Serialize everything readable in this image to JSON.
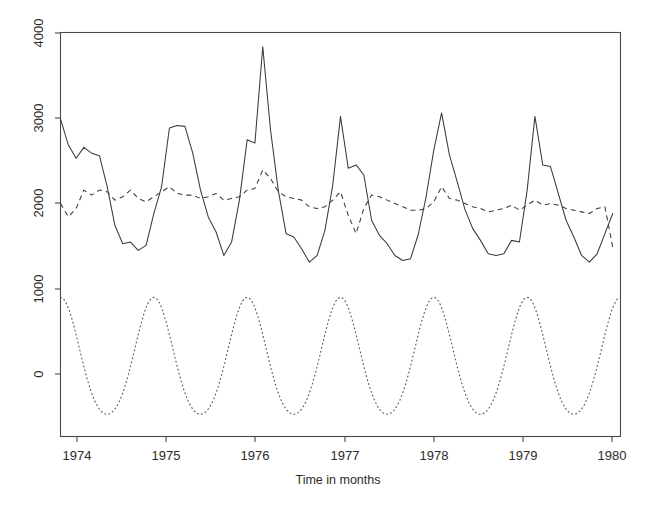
{
  "figure": {
    "background_color": "#ffffff",
    "line_color": "#3a3a3a",
    "axis_color": "#4a4a4a",
    "width": 652,
    "height": 509
  },
  "axes": {
    "x_title": "Time in months",
    "y_title": "",
    "x_tick_labels": [
      "1974",
      "1975",
      "1976",
      "1977",
      "1978",
      "1979",
      "1980"
    ],
    "y_tick_labels": [
      "0",
      "1000",
      "2000",
      "3000",
      "4000"
    ]
  },
  "chart_data": {
    "type": "line",
    "title": "",
    "xlabel": "Time in months",
    "ylabel": "",
    "xlim": [
      1974.0,
      1980.0
    ],
    "ylim": [
      -760,
      4060
    ],
    "xticks": [
      1974,
      1975,
      1976,
      1977,
      1978,
      1979,
      1980
    ],
    "yticks": [
      0,
      1000,
      2000,
      3000,
      4000
    ],
    "grid": false,
    "legend": "none",
    "x_unit": "year (monthly observations)",
    "series": [
      {
        "name": "observed",
        "style": "solid",
        "color": "#3a3a3a",
        "x": [
          1974.0,
          1974.083,
          1974.167,
          1974.25,
          1974.333,
          1974.417,
          1974.5,
          1974.583,
          1974.667,
          1974.75,
          1974.833,
          1974.917,
          1975.0,
          1975.083,
          1975.167,
          1975.25,
          1975.333,
          1975.417,
          1975.5,
          1975.583,
          1975.667,
          1975.75,
          1975.833,
          1975.917,
          1976.0,
          1976.083,
          1976.167,
          1976.25,
          1976.333,
          1976.417,
          1976.5,
          1976.583,
          1976.667,
          1976.75,
          1976.833,
          1976.917,
          1977.0,
          1977.083,
          1977.167,
          1977.25,
          1977.333,
          1977.417,
          1977.5,
          1977.583,
          1977.667,
          1977.75,
          1977.833,
          1977.917,
          1978.0,
          1978.083,
          1978.167,
          1978.25,
          1978.333,
          1978.417,
          1978.5,
          1978.583,
          1978.667,
          1978.75,
          1978.833,
          1978.917,
          1979.0,
          1979.083,
          1979.167,
          1979.25,
          1979.333,
          1979.417,
          1979.5,
          1979.583,
          1979.667,
          1979.75,
          1979.833,
          1979.917
        ],
        "values": [
          3030,
          2720,
          2560,
          2690,
          2620,
          2590,
          2220,
          1760,
          1540,
          1560,
          1460,
          1520,
          1900,
          2220,
          2920,
          2950,
          2940,
          2620,
          2180,
          1860,
          1680,
          1400,
          1560,
          2060,
          2780,
          2740,
          3890,
          2900,
          2180,
          1660,
          1620,
          1480,
          1320,
          1400,
          1700,
          2240,
          3060,
          2440,
          2480,
          2360,
          1820,
          1640,
          1540,
          1400,
          1340,
          1360,
          1650,
          2100,
          2660,
          3100,
          2600,
          2280,
          1950,
          1720,
          1580,
          1420,
          1400,
          1420,
          1580,
          1560,
          2180,
          3060,
          2480,
          2460,
          2140,
          1820,
          1620,
          1400,
          1320,
          1420,
          1660,
          1900
        ],
        "min": 1320,
        "max": 3890,
        "max_at": "1976 (early)",
        "description": "raw monthly series with strong annual peaks in early each year"
      },
      {
        "name": "seasonally-adjusted",
        "style": "dashed",
        "color": "#3a3a3a",
        "x": [
          1974.0,
          1974.083,
          1974.167,
          1974.25,
          1974.333,
          1974.417,
          1974.5,
          1974.583,
          1974.667,
          1974.75,
          1974.833,
          1974.917,
          1975.0,
          1975.083,
          1975.167,
          1975.25,
          1975.333,
          1975.417,
          1975.5,
          1975.583,
          1975.667,
          1975.75,
          1975.833,
          1975.917,
          1976.0,
          1976.083,
          1976.167,
          1976.25,
          1976.333,
          1976.417,
          1976.5,
          1976.583,
          1976.667,
          1976.75,
          1976.833,
          1976.917,
          1977.0,
          1977.083,
          1977.167,
          1977.25,
          1977.333,
          1977.417,
          1977.5,
          1977.583,
          1977.667,
          1977.75,
          1977.833,
          1977.917,
          1978.0,
          1978.083,
          1978.167,
          1978.25,
          1978.333,
          1978.417,
          1978.5,
          1978.583,
          1978.667,
          1978.75,
          1978.833,
          1978.917,
          1979.0,
          1979.083,
          1979.167,
          1979.25,
          1979.333,
          1979.417,
          1979.5,
          1979.583,
          1979.667,
          1979.75,
          1979.833,
          1979.917
        ],
        "values": [
          2020,
          1860,
          1960,
          2180,
          2120,
          2180,
          2160,
          2060,
          2100,
          2180,
          2080,
          2040,
          2100,
          2160,
          2220,
          2140,
          2120,
          2120,
          2080,
          2100,
          2140,
          2060,
          2080,
          2100,
          2180,
          2200,
          2420,
          2320,
          2160,
          2100,
          2080,
          2060,
          1980,
          1960,
          1980,
          2060,
          2160,
          1880,
          1660,
          1960,
          2120,
          2100,
          2060,
          2020,
          1980,
          1940,
          1940,
          1960,
          2040,
          2220,
          2080,
          2060,
          2020,
          1980,
          1960,
          1920,
          1940,
          1960,
          2000,
          1940,
          2000,
          2060,
          2000,
          2020,
          2000,
          1960,
          1940,
          1920,
          1900,
          1960,
          1980,
          1500
        ],
        "min": 1500,
        "max": 2420,
        "description": "smoothed / deseasonalised series fluctuating around 2000"
      },
      {
        "name": "seasonal",
        "style": "dotted",
        "color": "#5a5a5a",
        "period_months": 12,
        "amplitude_peak": 900,
        "amplitude_trough": -620,
        "peak_month": "January",
        "trough_month": "July",
        "description": "purely periodic seasonal component, peaks ~900 each January and troughs ~-620 each July"
      }
    ]
  }
}
